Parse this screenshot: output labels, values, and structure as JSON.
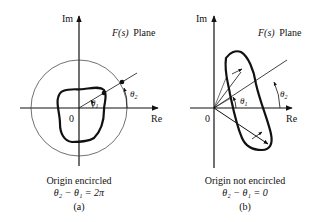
{
  "figure": {
    "panels": [
      {
        "id": "a",
        "axis_im_label": "Im",
        "axis_re_label": "Re",
        "origin_label": "0",
        "plane_label_fn": "F(s)",
        "plane_label_word": "Plane",
        "angle1_label": "θ",
        "angle1_sub": "1",
        "angle2_label": "θ",
        "angle2_sub": "2",
        "caption_line1": "Origin encircled",
        "caption_line2": "θ₂ − θ₁ = 2π",
        "caption_tag": "(a)"
      },
      {
        "id": "b",
        "axis_im_label": "Im",
        "axis_re_label": "Re",
        "origin_label": "0",
        "plane_label_fn": "F(s)",
        "plane_label_word": "Plane",
        "angle1_label": "θ",
        "angle1_sub": "1",
        "angle2_label": "θ",
        "angle2_sub": "2",
        "caption_line1": "Origin not encircled",
        "caption_line2": "θ₂ − θ₁ = 0",
        "caption_tag": "(b)"
      }
    ],
    "colors": {
      "ink": "#111111",
      "background": "#ffffff"
    }
  }
}
